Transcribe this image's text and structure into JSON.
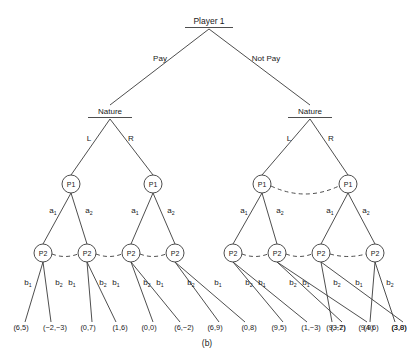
{
  "figure": {
    "caption": "(b)",
    "type": "extensive-form-game-tree"
  },
  "root": {
    "label": "Player 1",
    "x": 209,
    "y": 24
  },
  "root_actions": [
    {
      "label": "Pay",
      "x": 160,
      "y": 61
    },
    {
      "label": "Not Pay",
      "x": 266,
      "y": 61
    }
  ],
  "chance_nodes": [
    {
      "label": "Nature",
      "x": 110,
      "y": 114
    },
    {
      "label": "Nature",
      "x": 310,
      "y": 114
    }
  ],
  "chance_actions": [
    {
      "label": "L",
      "x": 89,
      "y": 141
    },
    {
      "label": "R",
      "x": 131,
      "y": 141
    },
    {
      "label": "L",
      "x": 289,
      "y": 141
    },
    {
      "label": "R",
      "x": 331,
      "y": 141
    }
  ],
  "p1_nodes": [
    {
      "label": "P1",
      "x": 71,
      "y": 184
    },
    {
      "label": "P1",
      "x": 153,
      "y": 184
    },
    {
      "label": "P1",
      "x": 262,
      "y": 184
    },
    {
      "label": "P1",
      "x": 348,
      "y": 184
    }
  ],
  "p1_actions": [
    {
      "base": "a",
      "sub": "1",
      "x": 53,
      "y": 213
    },
    {
      "base": "a",
      "sub": "2",
      "x": 89,
      "y": 213
    },
    {
      "base": "a",
      "sub": "1",
      "x": 135,
      "y": 213
    },
    {
      "base": "a",
      "sub": "2",
      "x": 171,
      "y": 213
    },
    {
      "base": "a",
      "sub": "1",
      "x": 244,
      "y": 213
    },
    {
      "base": "a",
      "sub": "2",
      "x": 280,
      "y": 213
    },
    {
      "base": "a",
      "sub": "1",
      "x": 330,
      "y": 213
    },
    {
      "base": "a",
      "sub": "2",
      "x": 366,
      "y": 213
    }
  ],
  "p2_nodes": [
    {
      "label": "P2",
      "x": 43,
      "y": 253
    },
    {
      "label": "P2",
      "x": 87,
      "y": 253
    },
    {
      "label": "P2",
      "x": 131,
      "y": 253
    },
    {
      "label": "P2",
      "x": 175,
      "y": 253
    },
    {
      "label": "P2",
      "x": 233,
      "y": 253
    },
    {
      "label": "P2",
      "x": 277,
      "y": 253
    },
    {
      "label": "P2",
      "x": 321,
      "y": 253
    },
    {
      "label": "P2",
      "x": 375,
      "y": 253
    }
  ],
  "p2_actions": [
    {
      "base": "b",
      "sub": "1",
      "x": 28,
      "y": 285
    },
    {
      "base": "b",
      "sub": "2",
      "x": 59,
      "y": 285
    },
    {
      "base": "b",
      "sub": "1",
      "x": 72,
      "y": 285
    },
    {
      "base": "b",
      "sub": "2",
      "x": 103,
      "y": 285
    },
    {
      "base": "b",
      "sub": "1",
      "x": 116,
      "y": 285
    },
    {
      "base": "b",
      "sub": "2",
      "x": 147,
      "y": 285
    },
    {
      "base": "b",
      "sub": "1",
      "x": 160,
      "y": 285
    },
    {
      "base": "b",
      "sub": "2",
      "x": 191,
      "y": 285
    },
    {
      "base": "b",
      "sub": "1",
      "x": 218,
      "y": 285
    },
    {
      "base": "b",
      "sub": "2",
      "x": 249,
      "y": 285
    },
    {
      "base": "b",
      "sub": "1",
      "x": 262,
      "y": 285
    },
    {
      "base": "b",
      "sub": "2",
      "x": 293,
      "y": 285
    },
    {
      "base": "b",
      "sub": "1",
      "x": 306,
      "y": 285
    },
    {
      "base": "b",
      "sub": "2",
      "x": 337,
      "y": 285
    },
    {
      "base": "b",
      "sub": "1",
      "x": 359,
      "y": 285
    },
    {
      "base": "b",
      "sub": "2",
      "x": 390,
      "y": 285
    }
  ],
  "payoffs": [
    {
      "text": "(6,5)",
      "x": 21,
      "y": 330
    },
    {
      "text": "(−2,−3)",
      "x": 55,
      "y": 330
    },
    {
      "text": "(0,7)",
      "x": 88,
      "y": 330
    },
    {
      "text": "(1,6)",
      "x": 120,
      "y": 330
    },
    {
      "text": "(0,0)",
      "x": 149,
      "y": 330
    },
    {
      "text": "(6,−2)",
      "x": 184,
      "y": 330
    },
    {
      "text": "(6,9)",
      "x": 215,
      "y": 330
    },
    {
      "text": "(0,8)",
      "x": 249,
      "y": 330
    },
    {
      "text": "(9,5)",
      "x": 279,
      "y": 330
    },
    {
      "text": "(1,−3)",
      "x": 311,
      "y": 330
    },
    {
      "text": "(3,7)",
      "x": 338,
      "y": 330
    },
    {
      "text": "(4,6)",
      "x": 371,
      "y": 330
    },
    {
      "text": "(3,0)",
      "x": 399,
      "y": 330
    },
    {
      "text": "(9,−2)",
      "x": 336,
      "y": 330
    },
    {
      "text": "(9,9)",
      "x": 366,
      "y": 330
    },
    {
      "text": "(3,8)",
      "x": 399,
      "y": 330
    }
  ],
  "colors": {
    "stroke": "#3a3a3a",
    "text": "#1a1a1a",
    "background": "#ffffff"
  }
}
